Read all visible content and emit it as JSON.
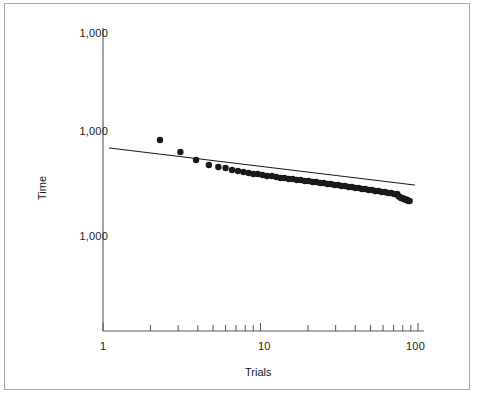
{
  "chart_data": {
    "type": "scatter",
    "title": "",
    "subtitle": "",
    "xlabel": "Trials",
    "ylabel": "Time",
    "xscale": "log",
    "yscale": "log",
    "xlim": [
      1,
      100
    ],
    "xticks": [
      1,
      10,
      100
    ],
    "xticklabels": [
      "1",
      "10",
      "100"
    ],
    "yticklabels": [
      "1,000",
      "1,000",
      "1,000"
    ],
    "grid": false,
    "legend": null,
    "x": [
      2.3,
      3.1,
      3.9,
      4.7,
      5.4,
      6.0,
      6.6,
      7.2,
      7.8,
      8.4,
      9.0,
      9.6,
      10.3,
      11.0,
      11.8,
      12.6,
      13.4,
      14.2,
      15.1,
      16.0,
      17.0,
      18.0,
      19.1,
      20.2,
      21.4,
      22.6,
      23.9,
      25.2,
      26.6,
      28.0,
      29.5,
      31.1,
      32.7,
      34.4,
      36.2,
      38.1,
      40.0,
      42.0,
      44.1,
      46.3,
      48.6,
      51.0,
      53.5,
      56.1,
      58.8,
      61.6,
      64.5,
      67.5,
      70.6,
      73.8,
      75.0,
      76.5,
      78.0,
      79.5,
      81.0,
      82.5,
      84.0,
      85.5,
      87.0,
      88.5
    ],
    "y_px": [
      140,
      152,
      160,
      165,
      167,
      168,
      170,
      171,
      172,
      173,
      174,
      174,
      175,
      176,
      176,
      177,
      178,
      178,
      179,
      179,
      180,
      180,
      181,
      181,
      182,
      182,
      183,
      183,
      184,
      184,
      185,
      185,
      186,
      186,
      187,
      187,
      188,
      188,
      189,
      189,
      190,
      190,
      191,
      191,
      192,
      192,
      193,
      193,
      194,
      194,
      196,
      197,
      198,
      198,
      199,
      199,
      200,
      200,
      201,
      201
    ],
    "fit_line": {
      "type": "power-law",
      "x_start": 1.1,
      "x_end": 95,
      "y_start_px": 148,
      "y_end_px": 185
    },
    "marker": {
      "shape": "circle",
      "size_px": 3.2,
      "color": "#1a1a1a"
    },
    "line_color": "#1a1a1a",
    "axis_color": "#555555",
    "background": "#ffffff",
    "border_color": "#a8a8a8"
  },
  "axes": {
    "y_labels": [
      {
        "text": "1,000",
        "top_px": 27
      },
      {
        "text": "1,000",
        "top_px": 125
      },
      {
        "text": "1,000",
        "top_px": 230
      }
    ],
    "x_labels": [
      {
        "text": "1",
        "left_px": 100
      },
      {
        "text": "10",
        "left_px": 258
      },
      {
        "text": "100",
        "left_px": 406
      }
    ],
    "x_title": "Trials",
    "y_title": "Time"
  }
}
